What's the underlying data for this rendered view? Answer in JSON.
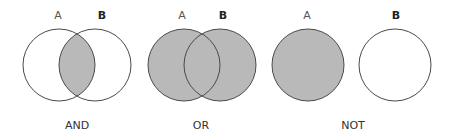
{
  "colors": {
    "fill": "#b9b9b9",
    "stroke": "#4a4a4a",
    "background": "#ffffff"
  },
  "panels": [
    {
      "operator": "AND",
      "set_labels": [
        "A",
        "B"
      ],
      "shaded": "intersection"
    },
    {
      "operator": "OR",
      "set_labels": [
        "A",
        "B"
      ],
      "shaded": "union"
    },
    {
      "operator": "NOT",
      "set_labels": [
        "A",
        "B"
      ],
      "shaded": "A only"
    }
  ]
}
